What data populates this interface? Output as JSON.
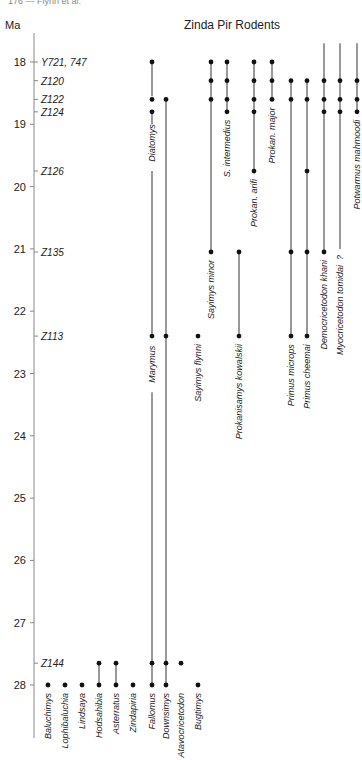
{
  "chart_data": {
    "type": "range",
    "title": "Zinda Pir Rodents",
    "page_header": "176 — Flynn et al.",
    "ylabel": "Ma",
    "ylim": [
      17.1,
      28.9
    ],
    "yticks": [
      18,
      19,
      20,
      21,
      22,
      23,
      24,
      25,
      26,
      27,
      28
    ],
    "grid": false,
    "sites": [
      {
        "label": "Y721, 747",
        "age": 18.0
      },
      {
        "label": "Z120",
        "age": 18.3
      },
      {
        "label": "Z122",
        "age": 18.6
      },
      {
        "label": "Z124",
        "age": 18.8
      },
      {
        "label": "Z126",
        "age": 19.75
      },
      {
        "label": "Z135",
        "age": 21.05
      },
      {
        "label": "Z113",
        "age": 22.4
      },
      {
        "label": "Z144",
        "age": 27.65
      }
    ],
    "taxa": [
      {
        "name": "Baluchimys",
        "col": 0,
        "occurrences": [
          28.0
        ],
        "range": null,
        "label_at": "bottom",
        "extends_up": false
      },
      {
        "name": "Lophibaluchia",
        "col": 1,
        "occurrences": [
          28.0
        ],
        "range": null,
        "label_at": "bottom",
        "extends_up": false
      },
      {
        "name": "Lindsaya",
        "col": 2,
        "occurrences": [
          28.0
        ],
        "range": null,
        "label_at": "bottom",
        "extends_up": false
      },
      {
        "name": "Hodsahibia",
        "col": 3,
        "occurrences": [
          27.65,
          28.0
        ],
        "range": [
          27.65,
          28.0
        ],
        "label_at": "bottom",
        "extends_up": false
      },
      {
        "name": "Asterratus",
        "col": 4,
        "occurrences": [
          27.65,
          28.0
        ],
        "range": [
          27.65,
          28.0
        ],
        "label_at": "bottom",
        "extends_up": false
      },
      {
        "name": "Zindapiria",
        "col": 5,
        "occurrences": [
          28.0
        ],
        "range": null,
        "label_at": "bottom",
        "extends_up": false
      },
      {
        "name": "Fallomus",
        "col": 6,
        "occurrences": [
          27.65,
          28.0
        ],
        "range": [
          22.4,
          28.0
        ],
        "label_at": "bottom",
        "extends_up": false
      },
      {
        "name": "Downsimys",
        "col": 7,
        "occurrences": [
          27.65,
          28.0
        ],
        "range": [
          22.4,
          28.0
        ],
        "label_at": "bottom",
        "extends_up": false
      },
      {
        "name": "Atavocricetodon",
        "col": 8,
        "occurrences": [
          27.65
        ],
        "range": null,
        "label_at": "bottom",
        "extends_up": false
      },
      {
        "name": "Bugtimys",
        "col": 9,
        "occurrences": [
          28.0
        ],
        "range": null,
        "label_at": "bottom",
        "extends_up": false
      },
      {
        "name": "Diatomys",
        "col": 6,
        "occurrences": [
          18.0,
          18.6,
          18.8
        ],
        "range": [
          18.0,
          22.4
        ],
        "label_at": "mid",
        "label_age": 19.3,
        "extends_up": false
      },
      {
        "name": "Marymus",
        "col": 6,
        "occurrences": [
          22.4
        ],
        "range": null,
        "label_at": "mid",
        "label_age": 22.85,
        "extends_up": false
      },
      {
        "name": "Marymus-stem",
        "col": 7,
        "occurrences": [
          18.6,
          22.4
        ],
        "range": [
          18.6,
          22.4
        ],
        "label_at": "none",
        "extends_up": false
      },
      {
        "name": "Sayimys flynni",
        "col": 9,
        "occurrences": [
          22.4
        ],
        "range": null,
        "label_at": "below",
        "extends_up": false
      },
      {
        "name": "Sayimys minor",
        "col": 10,
        "occurrences": [
          18.0,
          18.3,
          18.6,
          21.05
        ],
        "range": [
          18.0,
          21.05
        ],
        "label_at": "below",
        "extends_up": false
      },
      {
        "name": "S. intermedius",
        "col": 11,
        "occurrences": [
          18.0,
          18.3,
          18.6,
          18.8
        ],
        "range": [
          18.0,
          18.8
        ],
        "label_at": "below",
        "extends_up": false
      },
      {
        "name": "Prokanisamys kowalskii",
        "col": 12,
        "occurrences": [
          21.05,
          22.4
        ],
        "range": [
          21.05,
          22.4
        ],
        "label_at": "below",
        "extends_up": false
      },
      {
        "name": "Prokan. arifi",
        "col": 13,
        "occurrences": [
          18.0,
          18.3,
          18.6,
          18.8,
          19.75
        ],
        "range": [
          18.0,
          19.75
        ],
        "label_at": "below",
        "extends_up": false
      },
      {
        "name": "Prokan. major",
        "col": 14,
        "occurrences": [
          18.0,
          18.3,
          18.6
        ],
        "range": [
          18.0,
          18.6
        ],
        "label_at": "below",
        "extends_up": false
      },
      {
        "name": "Primus microps",
        "col": 15,
        "occurrences": [
          18.3,
          18.6,
          21.05,
          22.4
        ],
        "range": [
          18.3,
          22.4
        ],
        "label_at": "below",
        "extends_up": false
      },
      {
        "name": "Primus cheemai",
        "col": 16,
        "occurrences": [
          18.3,
          18.6,
          19.75,
          21.05,
          22.4
        ],
        "range": [
          18.3,
          22.4
        ],
        "label_at": "below",
        "extends_up": false
      },
      {
        "name": "Democricetodon khani",
        "col": 17,
        "occurrences": [
          18.3,
          18.6,
          18.8,
          21.05
        ],
        "range": [
          17.7,
          21.05
        ],
        "label_at": "below",
        "extends_up": true
      },
      {
        "name": "Myocricetodon tomidai",
        "col": 18,
        "occurrences": [
          18.3,
          18.6,
          18.8
        ],
        "range": [
          17.7,
          21.0
        ],
        "label_at": "below",
        "extends_up": true,
        "note": "?"
      },
      {
        "name": "Potwarmus mahmoodi",
        "col": 19,
        "occurrences": [
          18.3,
          18.6,
          18.8
        ],
        "range": [
          17.7,
          18.8
        ],
        "label_at": "below",
        "extends_up": true
      }
    ]
  }
}
